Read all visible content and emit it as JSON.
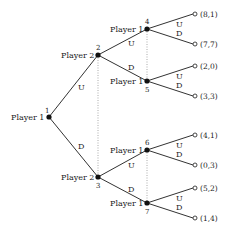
{
  "diagram": {
    "type": "game-tree",
    "nodes": [
      {
        "id": "1",
        "player": "Player 1"
      },
      {
        "id": "2",
        "player": "Player 2"
      },
      {
        "id": "3",
        "player": "Player 2"
      },
      {
        "id": "4",
        "player": "Player 1"
      },
      {
        "id": "5",
        "player": "Player 1"
      },
      {
        "id": "6",
        "player": "Player 1"
      },
      {
        "id": "7",
        "player": "Player 1"
      }
    ],
    "edges": [
      {
        "from": "1",
        "to": "2",
        "label": "U"
      },
      {
        "from": "1",
        "to": "3",
        "label": "D"
      },
      {
        "from": "2",
        "to": "4",
        "label": "U"
      },
      {
        "from": "2",
        "to": "5",
        "label": "D"
      },
      {
        "from": "3",
        "to": "6",
        "label": "U"
      },
      {
        "from": "3",
        "to": "7",
        "label": "D"
      },
      {
        "from": "4",
        "to": "t1",
        "label": "U"
      },
      {
        "from": "4",
        "to": "t2",
        "label": "D"
      },
      {
        "from": "5",
        "to": "t3",
        "label": "U"
      },
      {
        "from": "5",
        "to": "t4",
        "label": "D"
      },
      {
        "from": "6",
        "to": "t5",
        "label": "U"
      },
      {
        "from": "6",
        "to": "t6",
        "label": "D"
      },
      {
        "from": "7",
        "to": "t7",
        "label": "U"
      },
      {
        "from": "7",
        "to": "t8",
        "label": "D"
      }
    ],
    "payoffs": [
      "(8,1)",
      "(7,7)",
      "(2,0)",
      "(3,3)",
      "(4,1)",
      "(0,3)",
      "(5,2)",
      "(1,4)"
    ],
    "information_sets": [
      [
        "2",
        "3"
      ],
      [
        "4",
        "5"
      ],
      [
        "6",
        "7"
      ]
    ]
  }
}
